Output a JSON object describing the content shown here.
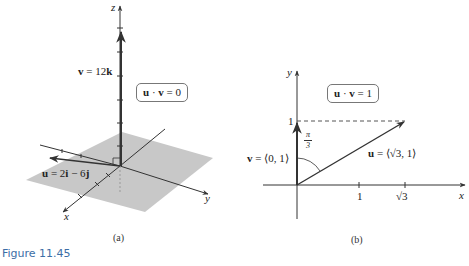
{
  "figure": {
    "caption": "Figure 11.45",
    "caption_color": "#3c6ea6"
  },
  "panel_a": {
    "sublabel": "(a)",
    "axes": {
      "x": "x",
      "y": "y",
      "z": "z"
    },
    "v_label_bold": "v",
    "v_label_rest": " = 12",
    "v_label_k": "k",
    "u_label_bold": "u",
    "u_label_rest": " = 2",
    "u_label_i": "i",
    "u_label_mid": " − 6",
    "u_label_j": "j",
    "dot_box": {
      "u": "u",
      "dot": " · ",
      "v": "v",
      "rest": " = 0"
    },
    "plane_color": "#c8c8c8"
  },
  "panel_b": {
    "sublabel": "(b)",
    "axes": {
      "x": "x",
      "y": "y"
    },
    "tick_labels": {
      "x1": "1",
      "xsqrt3": "√3",
      "y1": "1"
    },
    "angle_label": {
      "num": "π",
      "den": "3"
    },
    "v_label_bold": "v",
    "v_label_rest": " = ⟨0, 1⟩",
    "u_label_bold": "u",
    "u_label_rest": " = ⟨√3, 1⟩",
    "dot_box": {
      "u": "u",
      "dot": " · ",
      "v": "v",
      "rest": " = 1"
    }
  }
}
